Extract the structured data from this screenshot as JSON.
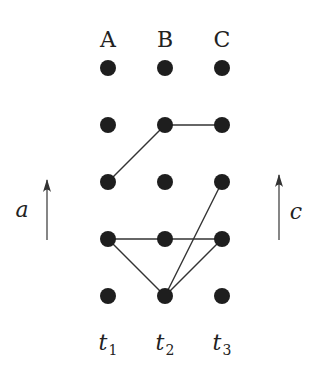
{
  "diagram": {
    "columns": [
      {
        "label": "A",
        "x": 108,
        "time_label": "t",
        "time_sub": "1"
      },
      {
        "label": "B",
        "x": 165,
        "time_label": "t",
        "time_sub": "2"
      },
      {
        "label": "C",
        "x": 222,
        "time_label": "t",
        "time_sub": "3"
      }
    ],
    "rows_y": [
      68,
      125,
      182,
      239,
      296
    ],
    "node_radius": 8,
    "node_color": "#1e1e1e",
    "edge_color": "#333333",
    "edges": [
      {
        "from": [
          0,
          2
        ],
        "to": [
          1,
          1
        ]
      },
      {
        "from": [
          1,
          1
        ],
        "to": [
          2,
          1
        ]
      },
      {
        "from": [
          0,
          3
        ],
        "to": [
          1,
          3
        ]
      },
      {
        "from": [
          1,
          3
        ],
        "to": [
          2,
          3
        ]
      },
      {
        "from": [
          0,
          3
        ],
        "to": [
          1,
          4
        ]
      },
      {
        "from": [
          1,
          4
        ],
        "to": [
          2,
          3
        ]
      },
      {
        "from": [
          1,
          4
        ],
        "to": [
          2,
          2
        ]
      }
    ],
    "left_axis": {
      "label": "a",
      "x": 47,
      "y_top": 180,
      "y_bottom": 240
    },
    "right_axis": {
      "label": "c",
      "x": 279,
      "y_top": 175,
      "y_bottom": 240
    }
  }
}
